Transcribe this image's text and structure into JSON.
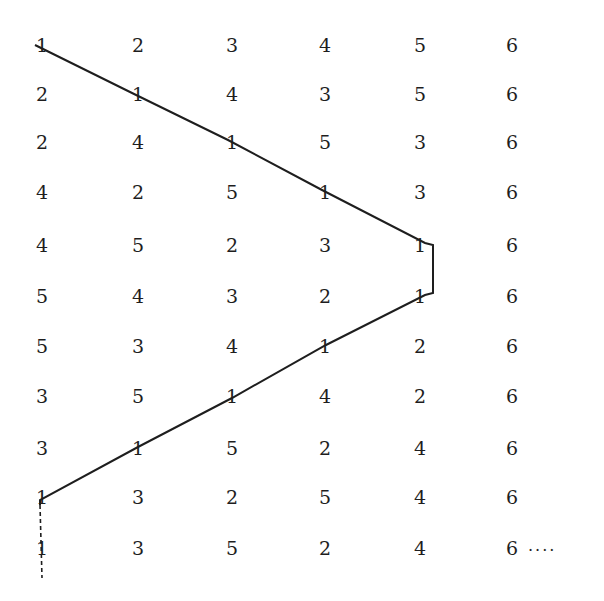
{
  "diagram": {
    "type": "permutation-grid-with-path",
    "columns": 6,
    "rows": [
      [
        1,
        2,
        3,
        4,
        5,
        6
      ],
      [
        2,
        1,
        4,
        3,
        5,
        6
      ],
      [
        2,
        4,
        1,
        5,
        3,
        6
      ],
      [
        4,
        2,
        5,
        1,
        3,
        6
      ],
      [
        4,
        5,
        2,
        3,
        1,
        6
      ],
      [
        5,
        4,
        3,
        2,
        1,
        6
      ],
      [
        5,
        3,
        4,
        1,
        2,
        6
      ],
      [
        3,
        5,
        1,
        4,
        2,
        6
      ],
      [
        3,
        1,
        5,
        2,
        4,
        6
      ],
      [
        1,
        3,
        2,
        5,
        4,
        6
      ],
      [
        1,
        3,
        5,
        2,
        4,
        6
      ]
    ],
    "trailing_ellipsis": "....",
    "path": {
      "description": "Line tracing the position of number 1 through each row",
      "solid_points": [
        [
          35,
          45
        ],
        [
          130,
          92
        ],
        [
          228,
          140
        ],
        [
          322,
          190
        ],
        [
          425,
          243
        ],
        [
          433,
          245
        ],
        [
          433,
          293
        ],
        [
          425,
          295
        ],
        [
          326,
          345
        ],
        [
          232,
          398
        ],
        [
          138,
          447
        ],
        [
          40,
          500
        ],
        [
          40,
          505
        ]
      ],
      "dashed_points": [
        [
          40,
          505
        ],
        [
          42,
          578
        ]
      ],
      "color": "#1e1e1e"
    }
  },
  "layout": {
    "col_x": [
      42,
      138,
      232,
      325,
      420,
      512
    ],
    "row_y": [
      45,
      94,
      142,
      192,
      245,
      296,
      346,
      396,
      448,
      497,
      548
    ]
  }
}
